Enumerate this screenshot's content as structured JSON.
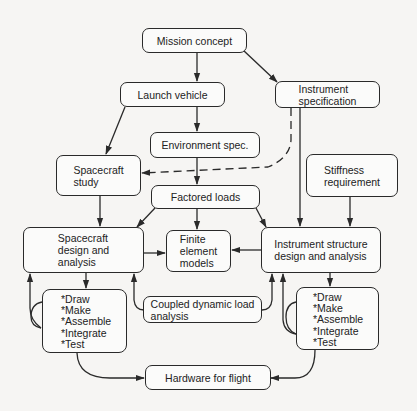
{
  "diagram": {
    "type": "flowchart",
    "colors": {
      "line": "#2a2a2a",
      "box_fill": "#fbfbfa",
      "background": "#f6f5f3",
      "text": "#222222"
    },
    "nodes": {
      "mission_concept": "Mission concept",
      "launch_vehicle": "Launch vehicle",
      "instrument_specification": "Instrument\nspecification",
      "environment_spec": "Environment spec.",
      "spacecraft_study": "Spacecraft\nstudy",
      "stiffness_requirement": "Stiffness\nrequirement",
      "factored_loads": "Factored loads",
      "spacecraft_design": "Spacecraft\ndesign and\nanalysis",
      "finite_element_models": "Finite\nelement\nmodels",
      "instrument_structure_design": "Instrument structure\ndesign and analysis",
      "coupled_dynamic_load": "Coupled dynamic load\nanalysis",
      "hardware_for_flight": "Hardware for flight"
    },
    "spacecraft_steps": [
      "*Draw",
      "*Make",
      "*Assemble",
      "*Integrate",
      "*Test"
    ],
    "instrument_steps": [
      "*Draw",
      "*Make",
      "*Assemble",
      "*Integrate",
      "*Test"
    ],
    "edges": [
      {
        "from": "Mission concept",
        "to": "Launch vehicle",
        "style": "solid"
      },
      {
        "from": "Mission concept",
        "to": "Instrument specification",
        "style": "solid"
      },
      {
        "from": "Launch vehicle",
        "to": "Environment spec.",
        "style": "solid"
      },
      {
        "from": "Launch vehicle",
        "to": "Spacecraft study",
        "style": "solid"
      },
      {
        "from": "Instrument specification",
        "to": "Spacecraft study",
        "style": "dashed"
      },
      {
        "from": "Instrument specification",
        "to": "Instrument structure design and analysis",
        "style": "solid"
      },
      {
        "from": "Environment spec.",
        "to": "Factored loads",
        "style": "solid"
      },
      {
        "from": "Stiffness requirement",
        "to": "Instrument structure design and analysis",
        "style": "solid"
      },
      {
        "from": "Spacecraft study",
        "to": "Spacecraft design and analysis",
        "style": "solid"
      },
      {
        "from": "Factored loads",
        "to": "Spacecraft design and analysis",
        "style": "solid"
      },
      {
        "from": "Factored loads",
        "to": "Finite element models",
        "style": "solid"
      },
      {
        "from": "Factored loads",
        "to": "Instrument structure design and analysis",
        "style": "solid"
      },
      {
        "from": "Spacecraft design and analysis",
        "to": "Finite element models",
        "style": "solid"
      },
      {
        "from": "Instrument structure design and analysis",
        "to": "Finite element models",
        "style": "solid"
      },
      {
        "from": "Spacecraft design and analysis",
        "to": "Spacecraft steps",
        "style": "solid"
      },
      {
        "from": "Spacecraft steps",
        "to": "Spacecraft design and analysis",
        "style": "solid"
      },
      {
        "from": "Instrument structure design and analysis",
        "to": "Instrument steps",
        "style": "solid"
      },
      {
        "from": "Instrument steps",
        "to": "Instrument structure design and analysis",
        "style": "solid"
      },
      {
        "from": "Coupled dynamic load analysis",
        "to": "Spacecraft design and analysis",
        "style": "solid"
      },
      {
        "from": "Coupled dynamic load analysis",
        "to": "Instrument structure design and analysis",
        "style": "solid"
      },
      {
        "from": "Spacecraft steps",
        "to": "Hardware for flight",
        "style": "solid"
      },
      {
        "from": "Instrument steps",
        "to": "Hardware for flight",
        "style": "solid"
      }
    ]
  }
}
